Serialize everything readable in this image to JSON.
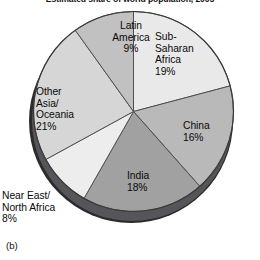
{
  "figure": {
    "title": "Estimated share of world population, 2005",
    "caption": "(b)"
  },
  "chart_data": {
    "type": "pie",
    "title": "Estimated share of world population, 2005",
    "xlabel": "",
    "ylabel": "",
    "legend_position": "none",
    "labels_inline": true,
    "units": "percent of world population",
    "start_angle_deg": 0,
    "direction": "clockwise",
    "categories": [
      "Sub-Saharan Africa",
      "China",
      "India",
      "Near East/North Africa",
      "Other Asia/Oceania",
      "Latin America"
    ],
    "values": [
      19,
      16,
      18,
      8,
      21,
      9
    ],
    "total": 91,
    "slices": [
      {
        "name": "sub-saharan-africa",
        "label": "Sub-\nSaharan\nAfrica\n19%",
        "name_text": "Sub-Saharan Africa",
        "value": 19,
        "value_text": "19%",
        "color": "#e9e9e9",
        "start_deg": 0,
        "end_deg": 68.4
      },
      {
        "name": "china",
        "label": "China\n16%",
        "name_text": "China",
        "value": 16,
        "value_text": "16%",
        "color": "#b9b9b9",
        "start_deg": 68.4,
        "end_deg": 126
      },
      {
        "name": "india",
        "label": "India\n18%",
        "name_text": "India",
        "value": 18,
        "value_text": "18%",
        "color": "#a1a1a1",
        "start_deg": 126,
        "end_deg": 190.8
      },
      {
        "name": "near-east-north-africa",
        "label": "Near East/\nNorth Africa\n8%",
        "name_text": "Near East/North Africa",
        "value": 8,
        "value_text": "8%",
        "color": "#ededed",
        "start_deg": 190.8,
        "end_deg": 219.6
      },
      {
        "name": "other-asia-oceania",
        "label": "Other\nAsia/\nOceania\n21%",
        "name_text": "Other Asia/Oceania",
        "value": 21,
        "value_text": "21%",
        "color": "#d6d6d6",
        "start_deg": 219.6,
        "end_deg": 295.2
      },
      {
        "name": "latin-america",
        "label": "Latin\nAmerica\n9%",
        "name_text": "Latin America",
        "value": 9,
        "value_text": "9%",
        "color": "#c1c1c1",
        "start_deg": 295.2,
        "end_deg": 327.6
      }
    ],
    "colors": {
      "slice_outline": "#4a4a4a",
      "rim_dark": "#2b2b2b",
      "rim_mid": "#55555a",
      "background": "#ffffff",
      "text": "#0a0a0a"
    }
  }
}
